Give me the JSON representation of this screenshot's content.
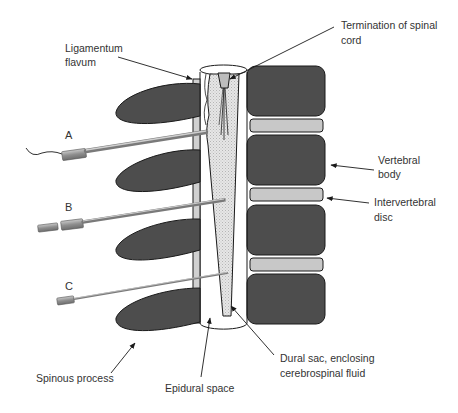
{
  "diagram": {
    "labels": {
      "ligamentum_flavum": [
        "Ligamentum",
        "flavum"
      ],
      "termination_spinal_cord": [
        "Termination of spinal",
        "cord"
      ],
      "vertebral_body": [
        "Vertebral",
        "body"
      ],
      "intervertebral_disc": [
        "Intervertebral",
        "disc"
      ],
      "spinous_process": [
        "Spinous process"
      ],
      "epidural_space": [
        "Epidural space"
      ],
      "dural_sac": [
        "Dural sac, enclosing",
        "cerebrospinal fluid"
      ]
    },
    "needles": [
      {
        "id": "A",
        "label": "A",
        "description": "Epidural catheter needle with catheter tail"
      },
      {
        "id": "B",
        "label": "B",
        "description": "Needle passing into dural sac"
      },
      {
        "id": "C",
        "label": "C",
        "description": "Fine needle into dural sac"
      }
    ],
    "colors": {
      "bone_dark": "#4d4d4d",
      "disc_light": "#c8c8c8",
      "ligament": "#d0d0d0",
      "csf_stipple": "#d9d9d9",
      "outline": "#1a1a1a",
      "needle": "#9a9a9a",
      "text": "#333333"
    }
  }
}
